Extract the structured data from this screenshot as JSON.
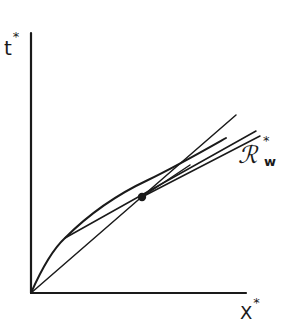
{
  "figure": {
    "type": "diagram",
    "colors": {
      "ink": "#1a1a1a",
      "background": "#ffffff"
    },
    "labels": {
      "y_axis": "t",
      "y_axis_sup": "*",
      "x_axis": "X",
      "x_axis_sup": "*",
      "curve": "ℛ",
      "curve_sup": "*",
      "curve_sub": "w"
    },
    "geometry": {
      "origin": [
        31,
        293
      ],
      "y_axis_top": [
        31,
        33
      ],
      "x_axis_end": [
        246,
        293
      ],
      "curve_points": "M31,293 C45,262 56,246 65,238 C90,212 120,192 150,180 C180,166 205,150 226,138",
      "chord_upper": [
        [
          65,
          238
        ],
        [
          236,
          115
        ]
      ],
      "chord_inner": [
        [
          65,
          238
        ],
        [
          142,
          197
        ],
        [
          195,
          168
        ]
      ],
      "ray_lower": [
        [
          31,
          293
        ],
        [
          142,
          197
        ],
        [
          260,
          133
        ]
      ],
      "ray_mid": [
        [
          31,
          293
        ],
        [
          256,
          130
        ]
      ],
      "marked_point": [
        142,
        197
      ]
    }
  }
}
